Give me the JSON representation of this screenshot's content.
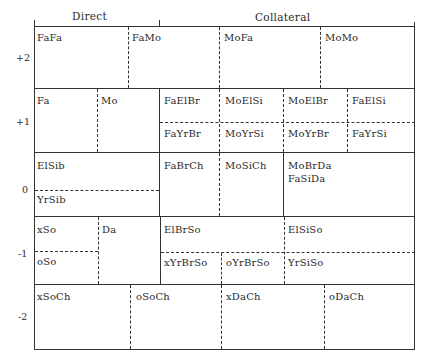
{
  "header": {
    "direct": "Direct",
    "collateral": "Collateral"
  },
  "generations": {
    "g_plus2": "+2",
    "g_plus1": "+1",
    "g_0": "0",
    "g_minus1": "-1",
    "g_minus2": "-2"
  },
  "cells": {
    "row_plus2": [
      "FaFa",
      "FaMo",
      "MoFa",
      "MoMo"
    ],
    "row_plus1_direct": [
      "Fa",
      "Mo"
    ],
    "row_plus1_collateral_upper": [
      "FaElBr",
      "MoElSi",
      "MoElBr",
      "FaElSi"
    ],
    "row_plus1_collateral_lower": [
      "FaYrBr",
      "MoYrSi",
      "MoYrBr",
      "FaYrSi"
    ],
    "row_0_direct": [
      "ElSib",
      "YrSib"
    ],
    "row_0_collateral": [
      "FaBrCh",
      "MoSiCh",
      "MoBrDa",
      "FaSiDa"
    ],
    "row_minus1_direct": [
      "xSo",
      "oSo",
      "Da"
    ],
    "row_minus1_collateral_upper": [
      "ElBrSo",
      "ElSiSo"
    ],
    "row_minus1_collateral_lower": [
      "xYrBrSo",
      "oYrBrSo",
      "YrSiSo"
    ],
    "row_minus2": [
      "xSoCh",
      "oSoCh",
      "xDaCh",
      "oDaCh"
    ]
  }
}
